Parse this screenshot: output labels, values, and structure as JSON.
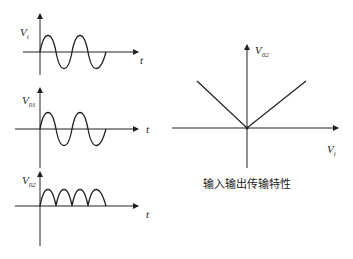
{
  "panels": {
    "input": {
      "y_label": "V",
      "y_sub": "i",
      "x_label": "t"
    },
    "out1": {
      "y_label": "V",
      "y_sub": "01",
      "x_label": "t"
    },
    "out2": {
      "y_label": "V",
      "y_sub": "02",
      "x_label": "t"
    }
  },
  "transfer": {
    "y_label": "V",
    "y_sub": "02",
    "x_label": "V",
    "x_sub": "i",
    "caption": "输入输出传输特性"
  }
}
